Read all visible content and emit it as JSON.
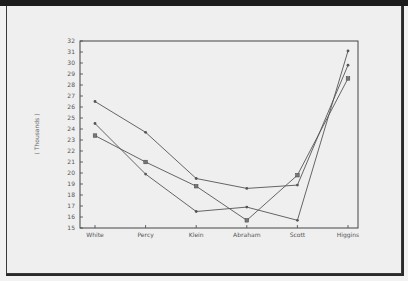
{
  "chart_data": {
    "type": "line",
    "title": "",
    "xlabel": "",
    "ylabel": "( Thousands )",
    "ylim": [
      15,
      32
    ],
    "yticks": [
      15,
      16,
      17,
      18,
      19,
      20,
      21,
      22,
      23,
      24,
      25,
      26,
      27,
      28,
      29,
      30,
      31,
      32
    ],
    "categories": [
      "White",
      "Percy",
      "Klein",
      "Abraham",
      "Scott",
      "Higgins"
    ],
    "grid": false,
    "legend": null,
    "series": [
      {
        "name": "Series 1",
        "marker": "dot",
        "values": [
          26.5,
          23.7,
          19.5,
          18.6,
          18.9,
          29.8
        ]
      },
      {
        "name": "Series 2",
        "marker": "dot",
        "values": [
          24.5,
          19.9,
          16.5,
          16.9,
          15.7,
          31.1
        ]
      },
      {
        "name": "Series 3",
        "marker": "square",
        "values": [
          23.4,
          21.0,
          18.8,
          15.7,
          19.8,
          28.6
        ]
      }
    ]
  },
  "colors": {
    "line": "#555555",
    "axis": "#444444",
    "background": "#efefef"
  }
}
